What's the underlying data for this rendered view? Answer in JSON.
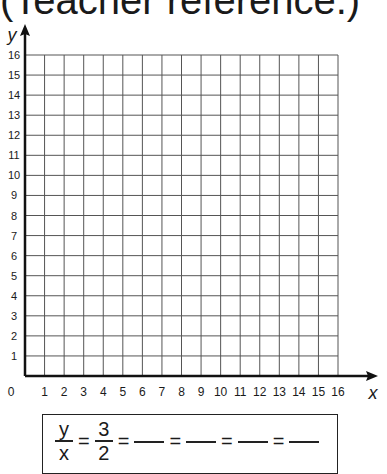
{
  "title": "(Teacher reference.)",
  "chart_data": {
    "type": "scatter",
    "title": "",
    "xlabel": "x",
    "ylabel": "y",
    "xlim": [
      0,
      16
    ],
    "ylim": [
      0,
      16
    ],
    "grid": true,
    "x_ticks": [
      "0",
      "1",
      "2",
      "3",
      "4",
      "5",
      "6",
      "7",
      "8",
      "9",
      "10",
      "11",
      "12",
      "13",
      "14",
      "15",
      "16"
    ],
    "y_ticks": [
      "1",
      "2",
      "3",
      "4",
      "5",
      "6",
      "7",
      "8",
      "9",
      "10",
      "11",
      "12",
      "13",
      "14",
      "15",
      "16"
    ],
    "series": []
  },
  "axes": {
    "x_label": "x",
    "y_label": "y",
    "origin_label": "0"
  },
  "ratio": {
    "lhs_num": "y",
    "lhs_den": "x",
    "equals": "=",
    "given_num": "3",
    "given_den": "2",
    "blank_count": 4
  },
  "colors": {
    "grid": "#555555",
    "axis": "#111111",
    "text": "#1a1a1a"
  }
}
